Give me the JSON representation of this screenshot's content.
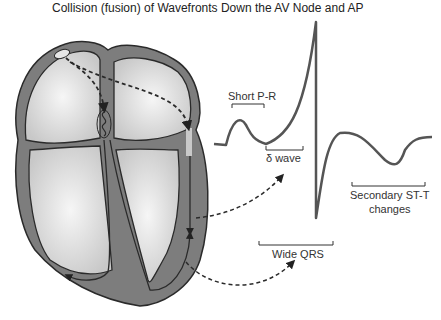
{
  "title": "Collision (fusion) of Wavefronts Down the AV Node and AP",
  "labels": {
    "short_pr": "Short P-R",
    "delta_wave": "δ wave",
    "wide_qrs": "Wide QRS",
    "st_t_line1": "Secondary ST-T",
    "st_t_line2": "changes"
  },
  "colors": {
    "myocardium": "#7a7a7a",
    "chamber": "#d9d9d9",
    "chamber_light": "#efefef",
    "outline": "#2a2a2a",
    "ecg": "#555555"
  }
}
